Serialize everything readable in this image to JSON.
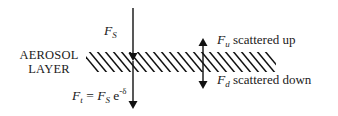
{
  "diagram": {
    "layer_label_line1": "AEROSOL",
    "layer_label_line2": "LAYER",
    "incident": {
      "symbol": "F",
      "subscript": "S"
    },
    "transmitted": {
      "symbol": "F",
      "subscript": "t",
      "equals": "=",
      "rhs_symbol": "F",
      "rhs_subscript": "S",
      "exp_base": "e",
      "exp_power": "-δ"
    },
    "scattered_up": {
      "symbol": "F",
      "subscript": "u",
      "text": "scattered up"
    },
    "scattered_down": {
      "symbol": "F",
      "subscript": "d",
      "text": "scattered down"
    },
    "colors": {
      "line": "#111111",
      "background": "#ffffff"
    }
  }
}
